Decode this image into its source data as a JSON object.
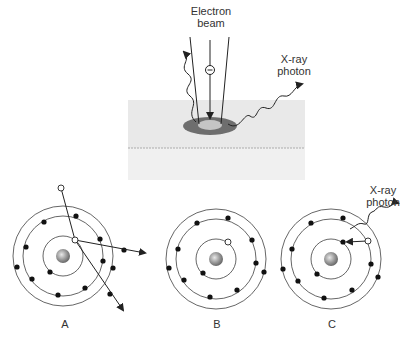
{
  "labels": {
    "electron_beam": [
      "Electron",
      "beam"
    ],
    "xray_photon_top": [
      "X-ray",
      "photon"
    ],
    "xray_photon_c": [
      "X-ray",
      "photon"
    ],
    "panel_a": "A",
    "panel_b": "B",
    "panel_c": "C"
  },
  "colors": {
    "ink": "#222222",
    "sample_top": "#ececec",
    "sample_front": "#f2f2f2",
    "spot_outer": "#6e6e6e",
    "spot_inner": "#bdbdbd",
    "orbit": "#555555",
    "electron": "#111111"
  }
}
